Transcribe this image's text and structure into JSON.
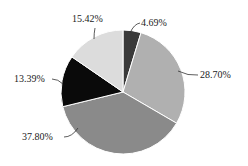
{
  "chart_data": {
    "type": "pie",
    "title": "",
    "start_angle_deg": 0,
    "direction": "clockwise",
    "slices": [
      {
        "label": "4.69%",
        "value": 4.69,
        "color": "#3a3a3a"
      },
      {
        "label": "28.70%",
        "value": 28.7,
        "color": "#b0b0b0"
      },
      {
        "label": "37.80%",
        "value": 37.8,
        "color": "#8a8a8a"
      },
      {
        "label": "13.39%",
        "value": 13.39,
        "color": "#0a0a0a"
      },
      {
        "label": "15.42%",
        "value": 15.42,
        "color": "#dcdcdc"
      }
    ],
    "legend": null
  },
  "labels": {
    "s0": "4.69%",
    "s1": "28.70%",
    "s2": "37.80%",
    "s3": "13.39%",
    "s4": "15.42%"
  }
}
